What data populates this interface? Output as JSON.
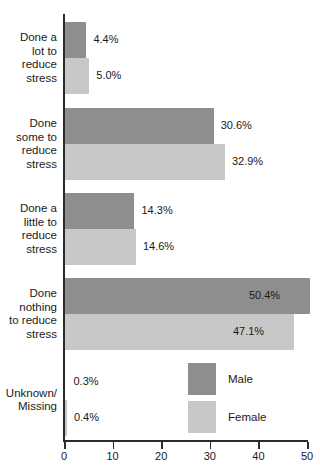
{
  "chart_data": {
    "type": "bar",
    "orientation": "horizontal",
    "title": "",
    "xlabel": "",
    "ylabel": "",
    "xlim": [
      0,
      50
    ],
    "xticks": [
      0,
      10,
      20,
      30,
      40,
      50
    ],
    "xtick_labels": [
      "0",
      "10",
      "20",
      "30",
      "40",
      "50"
    ],
    "grid": false,
    "legend_position": "inside-lower-right",
    "categories": [
      "Done a\nlot to\nreduce\nstress",
      "Done\nsome to\nreduce\nstress",
      "Done a\nlittle to\nreduce\nstress",
      "Done\nnothing\nto reduce\nstress",
      "Unknown/\nMissing"
    ],
    "series": [
      {
        "name": "Male",
        "color": "#8e8e8e",
        "values": [
          4.4,
          30.6,
          14.3,
          50.4,
          0.3
        ],
        "labels": [
          "4.4%",
          "30.6%",
          "14.3%",
          "50.4%",
          "0.3%"
        ]
      },
      {
        "name": "Female",
        "color": "#c8c8c8",
        "values": [
          5.0,
          32.9,
          14.6,
          47.1,
          0.4
        ],
        "labels": [
          "5.0%",
          "32.9%",
          "14.6%",
          "47.1%",
          "0.4%"
        ]
      }
    ]
  },
  "legend": {
    "items": [
      {
        "label": "Male",
        "color": "#8e8e8e"
      },
      {
        "label": "Female",
        "color": "#c8c8c8"
      }
    ]
  },
  "axis": {
    "x_tick_labels": [
      "0",
      "10",
      "20",
      "30",
      "40",
      "50"
    ]
  }
}
